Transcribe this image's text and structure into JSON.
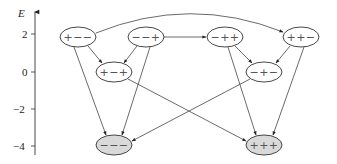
{
  "axis": {
    "label": "E",
    "ticks": [
      {
        "label": "2",
        "value": 2
      },
      {
        "label": "0",
        "value": 0
      },
      {
        "label": "−2",
        "value": -2
      },
      {
        "label": "−4",
        "value": -4
      }
    ]
  },
  "colors": {
    "ground_fill": "#d9d9d9",
    "node_fill": "#ffffff",
    "stroke": "#333333"
  },
  "nodes": [
    {
      "id": "pmm",
      "label": "+−−",
      "energy": 2,
      "ground": false
    },
    {
      "id": "mmp",
      "label": "−−+",
      "energy": 2,
      "ground": false
    },
    {
      "id": "mpp",
      "label": "−++",
      "energy": 2,
      "ground": false
    },
    {
      "id": "ppm",
      "label": "++−",
      "energy": 2,
      "ground": false
    },
    {
      "id": "pmp",
      "label": "+−+",
      "energy": 0,
      "ground": false
    },
    {
      "id": "mpm",
      "label": "−+−",
      "energy": 0,
      "ground": false
    },
    {
      "id": "mmm",
      "label": "−−−",
      "energy": -4,
      "ground": true
    },
    {
      "id": "ppp",
      "label": "+++",
      "energy": -4,
      "ground": true
    }
  ],
  "edges": [
    {
      "from": "+−−",
      "to": "++−"
    },
    {
      "from": "−−+",
      "to": "−++"
    },
    {
      "from": "+−−",
      "to": "+−+"
    },
    {
      "from": "−−+",
      "to": "+−+"
    },
    {
      "from": "−++",
      "to": "−+−"
    },
    {
      "from": "++−",
      "to": "−+−"
    },
    {
      "from": "+−−",
      "to": "−−−"
    },
    {
      "from": "−−+",
      "to": "−−−"
    },
    {
      "from": "−+−",
      "to": "−−−"
    },
    {
      "from": "+−+",
      "to": "+++"
    },
    {
      "from": "−++",
      "to": "+++"
    },
    {
      "from": "++−",
      "to": "+++"
    }
  ]
}
